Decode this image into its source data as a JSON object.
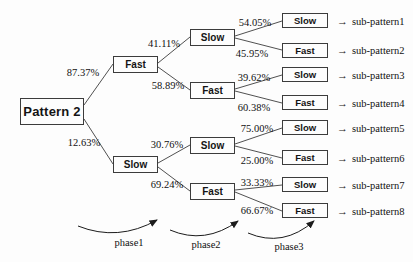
{
  "diagram_title": "Pattern 2 decision tree",
  "root": {
    "label": "Pattern 2"
  },
  "level2": [
    {
      "label": "Fast",
      "probability": "87.37%"
    },
    {
      "label": "Slow",
      "probability": "12.63%"
    }
  ],
  "level3": [
    {
      "label": "Slow",
      "probability": "41.11%"
    },
    {
      "label": "Fast",
      "probability": "58.89%"
    },
    {
      "label": "Slow",
      "probability": "30.76%"
    },
    {
      "label": "Fast",
      "probability": "69.24%"
    }
  ],
  "leaves": [
    {
      "label": "Slow",
      "probability": "54.05%",
      "result": "sub-pattern1"
    },
    {
      "label": "Fast",
      "probability": "45.95%",
      "result": "sub-pattern2"
    },
    {
      "label": "Slow",
      "probability": "39.62%",
      "result": "sub-pattern3"
    },
    {
      "label": "Fast",
      "probability": "60.38%",
      "result": "sub-pattern4"
    },
    {
      "label": "Slow",
      "probability": "75.00%",
      "result": "sub-pattern5"
    },
    {
      "label": "Fast",
      "probability": "25.00%",
      "result": "sub-pattern6"
    },
    {
      "label": "Slow",
      "probability": "33.33%",
      "result": "sub-pattern7"
    },
    {
      "label": "Fast",
      "probability": "66.67%",
      "result": "sub-pattern8"
    }
  ],
  "phases": [
    "phase1",
    "phase2",
    "phase3"
  ],
  "arrow_glyph": "→",
  "colors": {
    "line": "#3c3c3c",
    "box_border": "#3c3c3c",
    "text": "#111111",
    "background": "#fdfdfd"
  }
}
